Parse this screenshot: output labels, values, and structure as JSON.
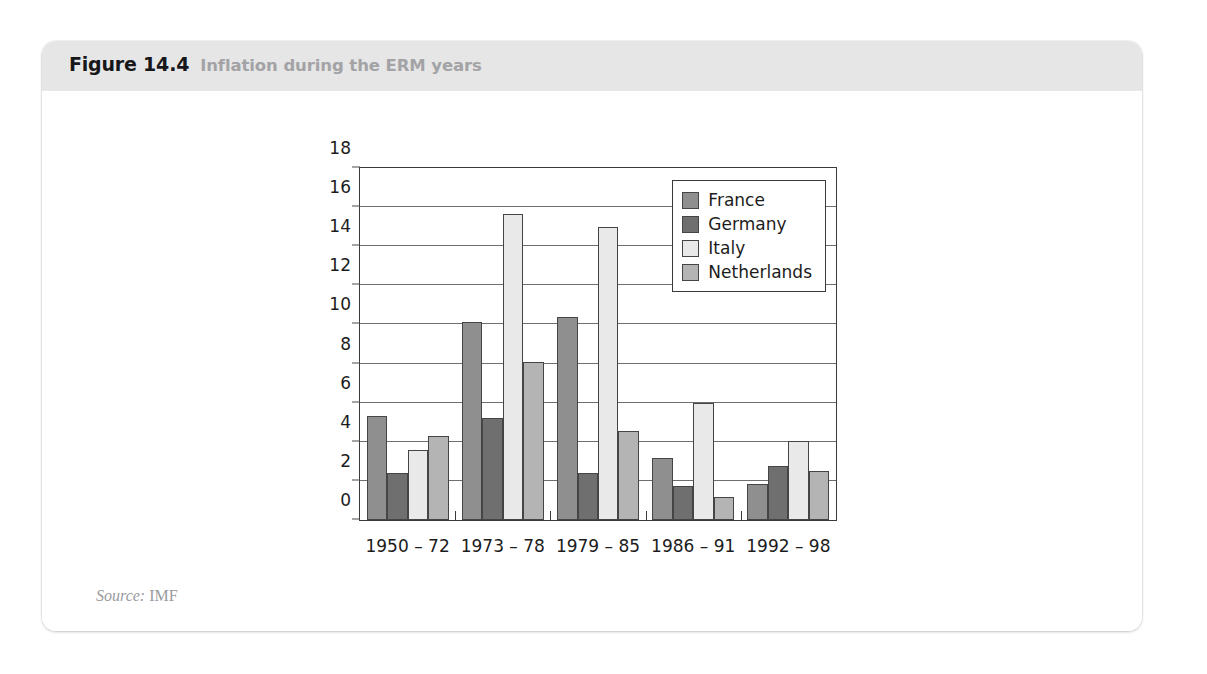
{
  "figure": {
    "label": "Figure 14.4",
    "title": "Inflation during the ERM years",
    "watermark": "",
    "source_keyword": "Source:",
    "source_value": "IMF"
  },
  "colors": {
    "france": "#8f8f8f",
    "germany": "#6f6f6f",
    "italy": "#e9e9e9",
    "netherlands": "#b4b4b4",
    "axis": "#3a3a3a",
    "grid": "#6e6e6e",
    "header_bg": "#e6e6e6",
    "title_gray": "#a3a3a6"
  },
  "chart_data": {
    "type": "bar",
    "title": "Inflation during the ERM years",
    "xlabel": "",
    "ylabel": "",
    "ylim": [
      0,
      18
    ],
    "yticks": [
      0,
      2,
      4,
      6,
      8,
      10,
      12,
      14,
      16,
      18
    ],
    "grid": true,
    "legend_position": "top-right",
    "categories": [
      "1950 – 72",
      "1973 – 78",
      "1979 – 85",
      "1986 – 91",
      "1992 – 98"
    ],
    "series": [
      {
        "name": "France",
        "values": [
          5.3,
          10.15,
          10.4,
          3.15,
          1.85
        ]
      },
      {
        "name": "Germany",
        "values": [
          2.4,
          5.2,
          2.4,
          1.75,
          2.75
        ]
      },
      {
        "name": "Italy",
        "values": [
          3.6,
          15.65,
          15.0,
          6.0,
          4.05
        ]
      },
      {
        "name": "Netherlands",
        "values": [
          4.3,
          8.1,
          4.55,
          1.2,
          2.5
        ]
      }
    ]
  }
}
